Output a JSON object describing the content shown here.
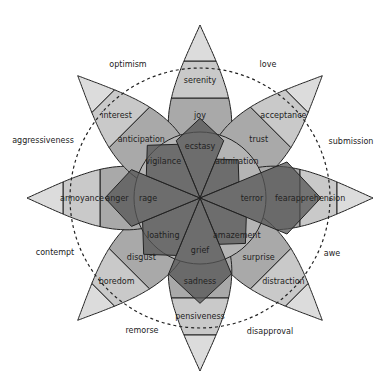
{
  "center": {
    "x": 200,
    "y": 198
  },
  "geometry": {
    "inner_radius": 44,
    "ring1": 100,
    "ring2": 137,
    "tip": 173,
    "dashed_radius": 130,
    "dyad_label_radius": 152,
    "petal_half_angle": 21
  },
  "petals": [
    {
      "angle": -90,
      "labels": [
        "ecstasy",
        "joy",
        "serenity"
      ]
    },
    {
      "angle": -45,
      "labels": [
        "admiration",
        "trust",
        "acceptance"
      ]
    },
    {
      "angle": 0,
      "labels": [
        "terror",
        "fear",
        "apprehension"
      ]
    },
    {
      "angle": 45,
      "labels": [
        "amazement",
        "surprise",
        "distraction"
      ]
    },
    {
      "angle": 90,
      "labels": [
        "grief",
        "sadness",
        "pensiveness"
      ]
    },
    {
      "angle": 135,
      "labels": [
        "loathing",
        "disgust",
        "boredom"
      ]
    },
    {
      "angle": 180,
      "labels": [
        "rage",
        "anger",
        "annoyance"
      ]
    },
    {
      "angle": 225,
      "labels": [
        "vigilance",
        "anticipation",
        "interest"
      ]
    }
  ],
  "petal_colors": [
    "#7d7d7d",
    "#a9a9a9",
    "#c9c9c9",
    "#dcdcdc"
  ],
  "dyads": [
    {
      "label": "love",
      "x": 268,
      "y": 67
    },
    {
      "label": "submission",
      "x": 351,
      "y": 144
    },
    {
      "label": "awe",
      "x": 332,
      "y": 256
    },
    {
      "label": "disapproval",
      "x": 270,
      "y": 334
    },
    {
      "label": "remorse",
      "x": 142,
      "y": 333
    },
    {
      "label": "contempt",
      "x": 55,
      "y": 255
    },
    {
      "label": "aggressiveness",
      "x": 43,
      "y": 143
    },
    {
      "label": "optimism",
      "x": 128,
      "y": 67
    }
  ],
  "radar": {
    "values": [
      0.6,
      0.35,
      1.0,
      0.45,
      0.85,
      0.6,
      0.75,
      0.55
    ],
    "fill": "#555555",
    "center_circle_fill": "#b4b4b4"
  },
  "chart_data": {
    "type": "radar",
    "title": "",
    "categories": [
      "joy",
      "trust",
      "fear",
      "surprise",
      "sadness",
      "disgust",
      "anger",
      "anticipation"
    ],
    "values": [
      0.6,
      0.35,
      1.0,
      0.45,
      0.85,
      0.6,
      0.75,
      0.55
    ]
  }
}
